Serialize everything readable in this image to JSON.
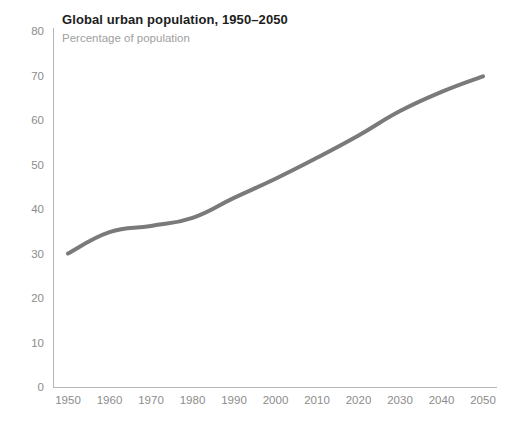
{
  "chart_data": {
    "type": "line",
    "title": "Global urban population, 1950–2050",
    "subtitle": "Percentage of population",
    "xlabel": "",
    "ylabel": "",
    "x": [
      1950,
      1960,
      1970,
      1980,
      1990,
      2000,
      2010,
      2020,
      2030,
      2040,
      2050
    ],
    "series": [
      {
        "name": "Global urban population",
        "color": "#7a7a7a",
        "values": [
          30.0,
          34.8,
          36.2,
          38.0,
          42.5,
          46.8,
          51.5,
          56.5,
          62.0,
          66.3,
          69.8
        ]
      }
    ],
    "xlim": [
      1950,
      2050
    ],
    "ylim": [
      0,
      80
    ],
    "xticks": [
      1950,
      1960,
      1970,
      1980,
      1990,
      2000,
      2010,
      2020,
      2030,
      2040,
      2050
    ],
    "xticklabels": [
      "1950",
      "1960",
      "1970",
      "1980",
      "1990",
      "2000",
      "2010",
      "2020",
      "2030",
      "2040",
      "2050"
    ],
    "yticks": [
      0,
      10,
      20,
      30,
      40,
      50,
      60,
      70,
      80
    ],
    "yticklabels": [
      "0",
      "10",
      "20",
      "30",
      "40",
      "50",
      "60",
      "70",
      "80"
    ],
    "grid": false,
    "legend": false,
    "legend_position": "none",
    "line_width": 4,
    "background_color": "#ffffff",
    "axis_color": "#b5b5b5",
    "tick_label_color": "#8c8c8c",
    "title_color": "#1d1d1d",
    "subtitle_color": "#a0a0a0"
  }
}
